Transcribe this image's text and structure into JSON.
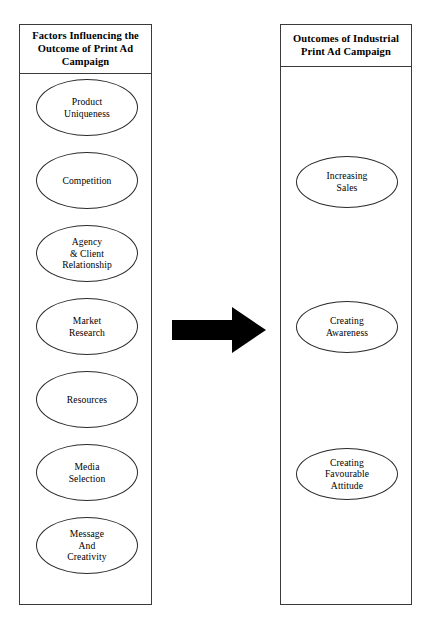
{
  "diagram": {
    "title": "Factors Influencing the Outcome of Print Ad Campaign",
    "left_panel": {
      "header": "Factors Influencing the\nOutcome of Print Ad\nCampaign",
      "nodes": [
        {
          "label": "Product\nUniqueness",
          "top": 78
        },
        {
          "label": "Competition",
          "top": 151
        },
        {
          "label": "Agency\n& Client\nRelationship",
          "top": 224
        },
        {
          "label": "Market\nResearch",
          "top": 297
        },
        {
          "label": "Resources",
          "top": 370
        },
        {
          "label": "Media\nSelection",
          "top": 443
        },
        {
          "label": "Message\nAnd\nCreativity",
          "top": 516
        }
      ]
    },
    "right_panel": {
      "header": "Outcomes of Industrial\nPrint Ad Campaign",
      "nodes": [
        {
          "label": "Increasing\nSales",
          "top": 155
        },
        {
          "label": "Creating\nAwareness",
          "top": 300
        },
        {
          "label": "Creating\nFavourable\nAttitude",
          "top": 447
        }
      ]
    },
    "connector": {
      "name": "right-arrow",
      "direction": "right",
      "color": "#000000"
    },
    "colors": {
      "background": "#ffffff",
      "border": "#3a3a3a",
      "node_border": "#2b2b2b",
      "text": "#000000",
      "arrow": "#000000"
    }
  }
}
